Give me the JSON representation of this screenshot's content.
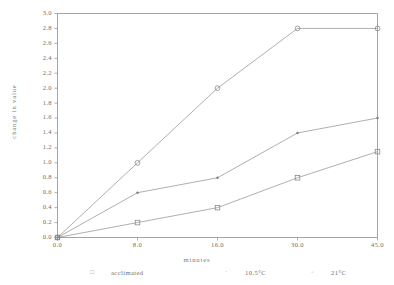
{
  "chart_data": {
    "type": "line",
    "title": "",
    "xlabel": "minutes",
    "ylabel": "change in value",
    "categories": [
      "0.0",
      "8.0",
      "16.0",
      "30.0",
      "45.0"
    ],
    "x": [
      0.0,
      8.0,
      16.0,
      30.0,
      45.0
    ],
    "ylim": [
      0.0,
      3.0
    ],
    "ytick_labels": [
      "0.0",
      "0.2",
      "0.4",
      "0.6",
      "0.8",
      "1.0",
      "1.2",
      "1.4",
      "1.6",
      "1.8",
      "2.0",
      "2.2",
      "2.4",
      "2.6",
      "2.8",
      "3.0"
    ],
    "ytick_values": [
      0.0,
      0.2,
      0.4,
      0.6,
      0.8,
      1.0,
      1.2,
      1.4,
      1.6,
      1.8,
      2.0,
      2.2,
      2.4,
      2.6,
      2.8,
      3.0
    ],
    "xtick_labels": [
      "0.0",
      "8.0",
      "16.0",
      "30.0",
      "45.0"
    ],
    "grid": false,
    "legend_position": "below",
    "series": [
      {
        "name": "21°C",
        "marker": "circle",
        "values": [
          0.0,
          1.0,
          2.0,
          2.8,
          2.8
        ]
      },
      {
        "name": "10.5°C",
        "marker": "dot",
        "values": [
          0.0,
          0.6,
          0.8,
          1.4,
          1.6
        ]
      },
      {
        "name": "acclimated",
        "marker": "square",
        "values": [
          0.0,
          0.2,
          0.4,
          0.8,
          1.15
        ]
      }
    ],
    "legend": [
      {
        "label": "acclimated",
        "marker": "square"
      },
      {
        "label": "10.5°C",
        "marker": "dot"
      },
      {
        "label": "21°C",
        "marker": "circle"
      }
    ]
  }
}
